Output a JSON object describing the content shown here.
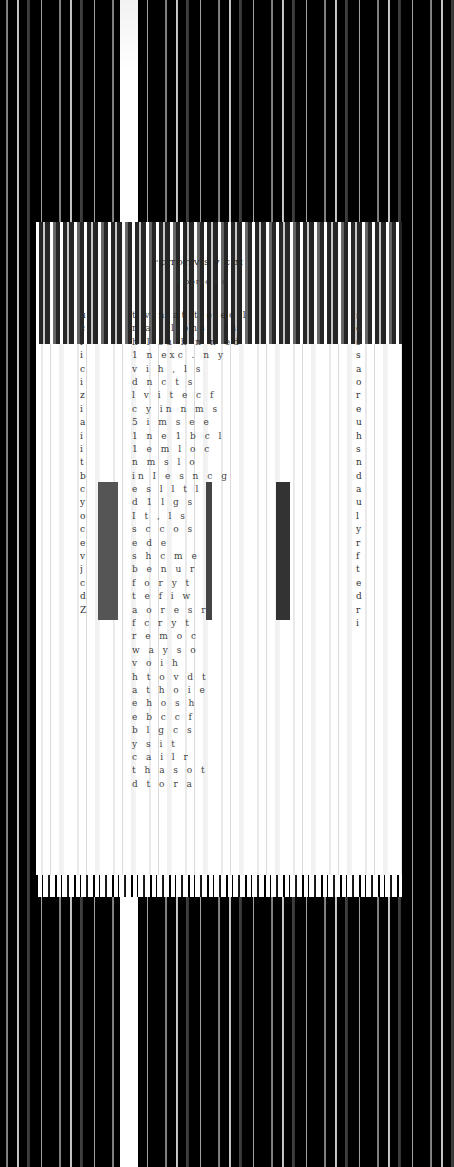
{
  "document": {
    "description": "Column-scrambled scan of a printed text page; words are not legible",
    "title_fragment": "'C   TO  TV  S  F  C  M",
    "subtitle_fragment": "u  pproc  d  s",
    "body_line_fragments": [
      "t   v   n   at   t   e   ec   l",
      "r   a    .  l   ons   i   ls",
      "h   l  su   h   n   n  ed",
      "1   n   exc   .   n   y",
      "v   i  h   ,   l   s",
      "d   n   c   t  s",
      "l   v  i   t   e   c   f",
      "c   y   in   n   m  s",
      "5   i   m   s  e  e",
      "1   n  e  1   b   c   l",
      "1   e   m   l   o   c",
      "  n   m   s   l   o",
      "in   I   e   s   n   c   g",
      "e   s   l   l   t   l",
      "d   1   l   g   s",
      "I   t   ,   l   s",
      "s   c   c   o   s",
      "e   d   e",
      "s   h   c   m   e",
      "b   e   n   u   r",
      "f   o   r   y   t",
      "t   e   f   i   w",
      "a   o   r   e   s   r",
      "f   c   r   y   t",
      "r   e   m   o   c",
      "w   a   y   s   o",
      "v   o   i   h",
      "h   t   o   v   d   t",
      "a   t   h   o   i   e",
      "e   h   o   s   h",
      "e   b   c   c   f",
      "b   l   g   c   s",
      "y   s   i   t",
      "c   a   i   l   r",
      "t   h   a   s   o   t",
      "d   t   o   r   a"
    ],
    "left_column_fragments": [
      "u",
      "c",
      "l",
      "i",
      "c",
      "i",
      "z",
      "i",
      "a",
      "i",
      "i",
      "t",
      "b",
      "c",
      "y",
      "o",
      "c",
      "e",
      "v",
      "j",
      "c",
      "d",
      "Z"
    ],
    "right_column_fragments": [
      "s",
      "o",
      "s",
      "s",
      "a",
      "o",
      "r",
      "e",
      "u",
      "h",
      "s",
      "n",
      "d",
      "a",
      "u",
      "l",
      "y",
      "r",
      "f",
      "t",
      "e",
      "d",
      "r",
      "i"
    ]
  },
  "colors": {
    "background": "#000000",
    "page": "#ffffff",
    "text": "#222222"
  }
}
